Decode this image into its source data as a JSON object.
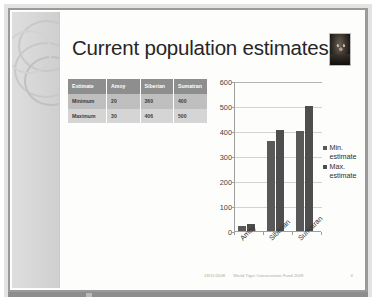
{
  "slide": {
    "title": "Current population estimates",
    "thumbnail_name": "tiger-photo-thumbnail"
  },
  "table": {
    "columns": [
      "Estimate",
      "Amoy",
      "Siberian",
      "Sumatran"
    ],
    "rows": [
      {
        "label": "Minimum",
        "amoy": "20",
        "siberian": "360",
        "sumatran": "400"
      },
      {
        "label": "Maximum",
        "amoy": "30",
        "siberian": "406",
        "sumatran": "500"
      }
    ]
  },
  "chart_data": {
    "type": "bar",
    "title": "",
    "xlabel": "",
    "ylabel": "",
    "categories": [
      "Amoy",
      "Siberian",
      "Sumatran"
    ],
    "series": [
      {
        "name": "Min. estimate",
        "values": [
          20,
          360,
          400
        ],
        "color": "#595959"
      },
      {
        "name": "Max. estimate",
        "values": [
          30,
          406,
          500
        ],
        "color": "#4e4e4e"
      }
    ],
    "ylim": [
      0,
      600
    ],
    "yticks": [
      "600",
      "500",
      "400",
      "300",
      "200",
      "100",
      "0"
    ],
    "grid": true,
    "legend_position": "right"
  },
  "legend": {
    "entries": [
      {
        "line1": "Min.",
        "line2": "estimate"
      },
      {
        "line1": "Max.",
        "line2": "estimate"
      }
    ]
  },
  "footer": {
    "date": "18/11/2008",
    "organisation": "World Tiger Conservation Fund 2009",
    "page": "4"
  }
}
